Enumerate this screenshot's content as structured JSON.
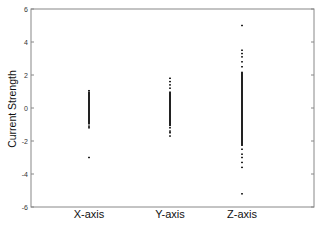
{
  "chart_data": {
    "type": "scatter",
    "title": "",
    "xlabel": "",
    "ylabel": "Current Strength",
    "categories": [
      "X-axis",
      "Y-axis",
      "Z-axis"
    ],
    "ylim": [
      -6,
      6
    ],
    "yticks": [
      6,
      4,
      2,
      0,
      -2,
      -4,
      -6
    ],
    "grid": false,
    "legend": null,
    "series": [
      {
        "name": "X-axis",
        "dense_range": [
          -1.0,
          1.0
        ],
        "points": [
          1.05,
          -1.1,
          -1.2,
          -3.0
        ]
      },
      {
        "name": "Y-axis",
        "dense_range": [
          -1.1,
          1.0
        ],
        "points": [
          1.8,
          1.6,
          1.4,
          1.2,
          -1.2,
          -1.4,
          -1.5,
          -1.7
        ]
      },
      {
        "name": "Z-axis",
        "dense_range": [
          -2.3,
          2.2
        ],
        "points": [
          5.0,
          3.5,
          3.3,
          3.1,
          2.8,
          2.5,
          -2.5,
          -2.8,
          -3.0,
          -3.3,
          -3.6,
          -5.2
        ]
      }
    ]
  },
  "colors": {
    "axis": "#888888",
    "points": "#222222",
    "background": "#ffffff"
  }
}
